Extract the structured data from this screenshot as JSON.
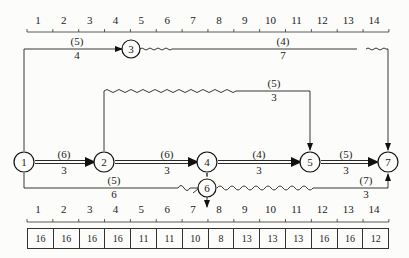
{
  "diagram": {
    "type": "time-scaled double-code network",
    "time_scale_top": [
      "1",
      "2",
      "3",
      "4",
      "5",
      "6",
      "7",
      "8",
      "9",
      "10",
      "11",
      "12",
      "13",
      "14"
    ],
    "time_scale_bottom": [
      "1",
      "2",
      "3",
      "4",
      "5",
      "6",
      "7",
      "8",
      "9",
      "10",
      "11",
      "12",
      "13",
      "14"
    ],
    "resource_row": [
      "16",
      "16",
      "16",
      "16",
      "11",
      "11",
      "10",
      "8",
      "13",
      "13",
      "13",
      "16",
      "16",
      "12"
    ],
    "nodes": [
      {
        "id": "1",
        "label": "1"
      },
      {
        "id": "2",
        "label": "2"
      },
      {
        "id": "3",
        "label": "3"
      },
      {
        "id": "4",
        "label": "4"
      },
      {
        "id": "5",
        "label": "5"
      },
      {
        "id": "6",
        "label": "6"
      },
      {
        "id": "7",
        "label": "7"
      }
    ],
    "activities": [
      {
        "from": "1",
        "to": "3",
        "resource": "(5)",
        "duration": "4",
        "critical": false
      },
      {
        "from": "3",
        "to": "7",
        "resource": "(4)",
        "duration": "7",
        "critical": false
      },
      {
        "from": "2",
        "to": "5",
        "resource": "(5)",
        "duration": "3",
        "critical": false
      },
      {
        "from": "1",
        "to": "2",
        "resource": "(6)",
        "duration": "3",
        "critical": true
      },
      {
        "from": "2",
        "to": "4",
        "resource": "(6)",
        "duration": "3",
        "critical": true
      },
      {
        "from": "4",
        "to": "5",
        "resource": "(4)",
        "duration": "3",
        "critical": true
      },
      {
        "from": "5",
        "to": "7",
        "resource": "(5)",
        "duration": "3",
        "critical": true
      },
      {
        "from": "1",
        "to": "6",
        "resource": "(5)",
        "duration": "6",
        "critical": false
      },
      {
        "from": "6",
        "to": "7",
        "resource": "(7)",
        "duration": "3",
        "critical": false
      },
      {
        "from": "4",
        "to": "6",
        "resource": "",
        "duration": "",
        "critical": false,
        "dummy": true
      }
    ]
  }
}
